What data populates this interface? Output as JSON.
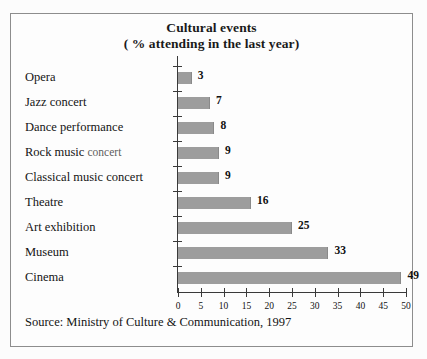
{
  "figure": {
    "title_line1": "Cultural events",
    "title_line2": "( % attending in the last year)",
    "source_note": "Source: Ministry of Culture & Communication, 1997",
    "frame_color": "#8d8d8d",
    "bar_color": "#9d9d9d",
    "axis_color": "#3a3a3a",
    "background_color": "#fdfdfd"
  },
  "chart_data": {
    "type": "bar",
    "orientation": "horizontal",
    "title": "Cultural events ( % attending in the last year)",
    "xlabel": "",
    "ylabel": "",
    "xlim": [
      0,
      50
    ],
    "xticks": [
      0,
      5,
      10,
      15,
      20,
      25,
      30,
      35,
      40,
      45,
      50
    ],
    "xtick_labels": [
      "0",
      "5",
      "10",
      "15",
      "20",
      "25",
      "30",
      "35",
      "40",
      "45",
      "50"
    ],
    "grid": false,
    "legend": false,
    "value_labels": true,
    "units": "% attending in the last year",
    "categories": [
      "Opera",
      "Jazz concert",
      "Dance performance",
      "Rock music concert",
      "Classical music concert",
      "Theatre",
      "Art exhibition",
      "Museum",
      "Cinema"
    ],
    "values": [
      3,
      7,
      8,
      9,
      9,
      16,
      25,
      33,
      49
    ],
    "value_label_texts": [
      "3",
      "7",
      "8",
      "9",
      "9",
      "16",
      "25",
      "33",
      "49"
    ]
  }
}
